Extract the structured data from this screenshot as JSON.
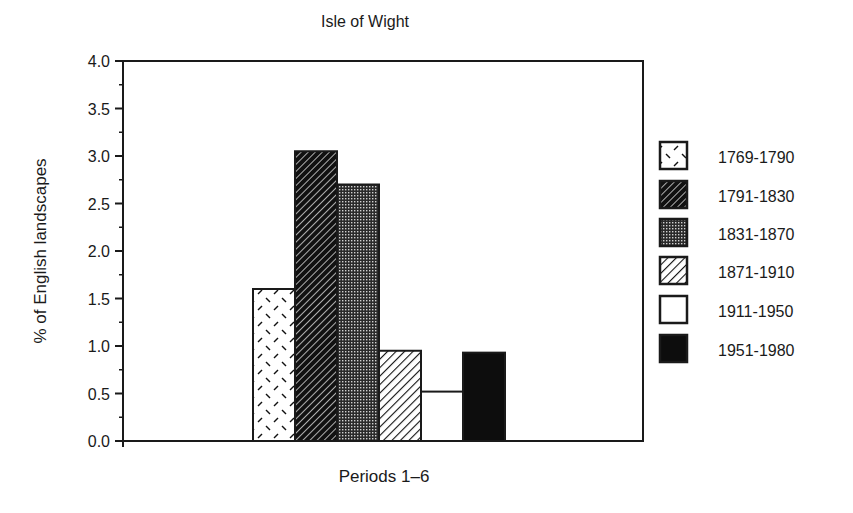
{
  "chart_data": {
    "type": "bar",
    "title": "Isle of Wight",
    "xlabel": "Periods 1–6",
    "ylabel": "% of English landscapes",
    "ylim": [
      0,
      4.0
    ],
    "yticks": [
      "0.0",
      "0.5",
      "1.0",
      "1.5",
      "2.0",
      "2.5",
      "3.0",
      "3.5",
      "4.0"
    ],
    "ytick_values": [
      0,
      0.5,
      1.0,
      1.5,
      2.0,
      2.5,
      3.0,
      3.5,
      4.0
    ],
    "minor_tick_step": 0.25,
    "grid": false,
    "legend_position": "right",
    "categories": [
      "Periods 1–6"
    ],
    "series": [
      {
        "name": "1769-1790",
        "values": [
          1.6
        ],
        "pattern": "dashed-sparse"
      },
      {
        "name": "1791-1830",
        "values": [
          3.05
        ],
        "pattern": "dark-hatch"
      },
      {
        "name": "1831-1870",
        "values": [
          2.7
        ],
        "pattern": "stipple"
      },
      {
        "name": "1871-1910",
        "values": [
          0.95
        ],
        "pattern": "light-hatch"
      },
      {
        "name": "1911-1950",
        "values": [
          0.52
        ],
        "pattern": "white"
      },
      {
        "name": "1951-1980",
        "values": [
          0.93
        ],
        "pattern": "black"
      }
    ]
  }
}
